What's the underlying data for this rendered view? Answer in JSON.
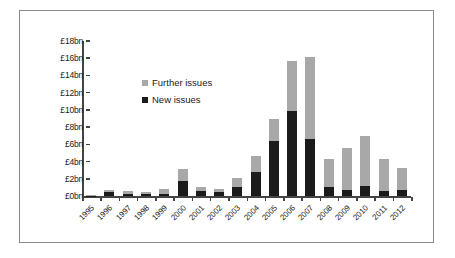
{
  "chart_data": {
    "type": "bar",
    "stacked": true,
    "title": "",
    "xlabel": "",
    "ylabel": "",
    "ylim": [
      0,
      18
    ],
    "grid": false,
    "legend_position": "inside-upper-left",
    "y_tick_labels": [
      "£18bn",
      "£16bn",
      "£14bn",
      "£12bn",
      "£10bn",
      "£8bn",
      "£6bn",
      "£4bn",
      "£2bn",
      "£0bn"
    ],
    "y_ticks": [
      18,
      16,
      14,
      12,
      10,
      8,
      6,
      4,
      2,
      0
    ],
    "categories": [
      "1995",
      "1996",
      "1997",
      "1998",
      "1999",
      "2000",
      "2001",
      "2002",
      "2003",
      "2004",
      "2005",
      "2006",
      "2007",
      "2008",
      "2009",
      "2010",
      "2011",
      "2012"
    ],
    "series": [
      {
        "name": "New issues",
        "color": "#1b1b1b",
        "values": [
          0.05,
          0.45,
          0.25,
          0.2,
          0.25,
          1.75,
          0.6,
          0.45,
          1.1,
          2.75,
          6.4,
          9.9,
          6.6,
          1.1,
          0.65,
          1.2,
          0.6,
          0.75
        ]
      },
      {
        "name": "Further issues",
        "color": "#a8a8a8",
        "values": [
          0.05,
          0.3,
          0.35,
          0.25,
          0.6,
          1.35,
          0.5,
          0.4,
          1.0,
          1.85,
          2.5,
          5.8,
          9.5,
          3.15,
          4.95,
          5.8,
          3.7,
          2.45
        ]
      }
    ],
    "totals": [
      0.1,
      0.75,
      0.6,
      0.45,
      0.85,
      3.1,
      1.1,
      0.85,
      2.1,
      4.6,
      8.9,
      15.7,
      16.1,
      4.25,
      5.6,
      7.0,
      4.3,
      3.2
    ]
  },
  "legend": {
    "items": [
      {
        "label": "Further issues",
        "swatch": "further"
      },
      {
        "label": "New issues",
        "swatch": "new"
      }
    ]
  }
}
